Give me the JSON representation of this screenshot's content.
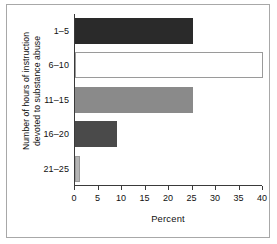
{
  "chart_data": {
    "type": "bar",
    "orientation": "horizontal",
    "title": "",
    "xlabel": "Percent",
    "ylabel": "Number of hours of instruction devoted to substance abuse",
    "ylabel_lines": [
      "Number of hours of instruction",
      "devoted to substance abuse"
    ],
    "categories": [
      "1–5",
      "6–10",
      "11–15",
      "16–20",
      "21–25"
    ],
    "values": [
      25,
      40,
      25,
      9,
      1
    ],
    "bar_colors": [
      "#2a2a2a",
      "#ffffff",
      "#8a8a8a",
      "#4a4a4a",
      "#b5b5b5"
    ],
    "bar_border_color": "#9a9a9a",
    "xlim": [
      0,
      40
    ],
    "xticks": [
      0,
      5,
      10,
      15,
      20,
      25,
      30,
      35,
      40
    ],
    "xtick_labels": [
      "0",
      "5",
      "10",
      "15",
      "20",
      "25",
      "30",
      "35",
      "40"
    ],
    "grid": false,
    "legend": null,
    "frame_color": "#a8a8a8",
    "axis_color": "#3a3a3a",
    "background": "#ffffff"
  }
}
